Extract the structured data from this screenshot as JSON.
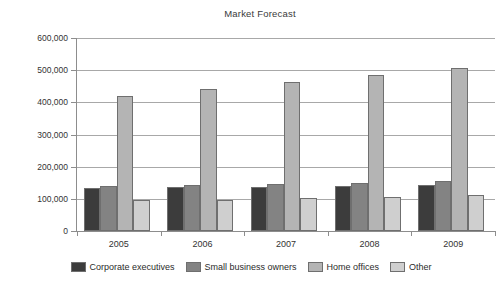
{
  "chart_data": {
    "type": "bar",
    "title": "Market Forecast",
    "xlabel": "",
    "ylabel": "",
    "categories": [
      "2005",
      "2006",
      "2007",
      "2008",
      "2009"
    ],
    "series": [
      {
        "name": "Corporate executives",
        "color": "#3c3c3c",
        "values": [
          134000,
          136000,
          137000,
          140000,
          142000
        ]
      },
      {
        "name": "Small business owners",
        "color": "#838383",
        "values": [
          140000,
          144000,
          147000,
          150000,
          155000
        ]
      },
      {
        "name": "Home offices",
        "color": "#b4b4b4",
        "values": [
          419000,
          440000,
          462000,
          485000,
          508000
        ]
      },
      {
        "name": "Other",
        "color": "#cfcfcf",
        "values": [
          95000,
          97000,
          103000,
          106000,
          112000
        ]
      }
    ],
    "ylim": [
      0,
      600000
    ],
    "ytick_values": [
      0,
      100000,
      200000,
      300000,
      400000,
      500000,
      600000
    ],
    "ytick_labels": [
      "0",
      "100,000",
      "200,000",
      "300,000",
      "400,000",
      "500,000",
      "600,000"
    ],
    "grid": true,
    "legend_position": "bottom"
  }
}
